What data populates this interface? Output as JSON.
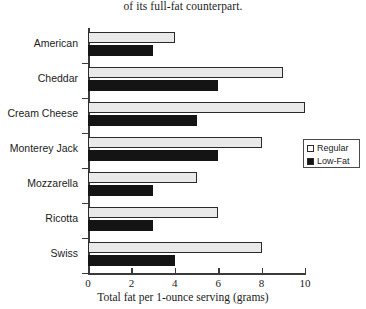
{
  "caption": "of its full-fat counterpart.",
  "legend": {
    "position": "right",
    "entries": [
      {
        "label": "Regular",
        "swatch": "regular-swatch-icon"
      },
      {
        "label": "Low-Fat",
        "swatch": "lowfat-swatch-icon"
      }
    ]
  },
  "colors": {
    "regular_fill": "#e9e9e9",
    "regular_border": "#2a2a2a",
    "lowfat_fill": "#141414",
    "axis": "#3a3a3a",
    "text": "#1b1b1b",
    "background": "#ffffff"
  },
  "chart_data": {
    "type": "bar",
    "orientation": "horizontal",
    "title": "of its full-fat counterpart.",
    "xlabel": "Total fat per 1-ounce serving (grams)",
    "ylabel": "",
    "xlim": [
      0,
      10
    ],
    "xticks": [
      0,
      2,
      4,
      6,
      8,
      10
    ],
    "xtick_labels": [
      "0",
      "2",
      "4",
      "6",
      "8",
      "10"
    ],
    "grid": false,
    "legend_position": "right",
    "categories": [
      "American",
      "Cheddar",
      "Cream Cheese",
      "Monterey Jack",
      "Mozzarella",
      "Ricotta",
      "Swiss"
    ],
    "series": [
      {
        "name": "Regular",
        "values": [
          4,
          9,
          10,
          8,
          5,
          6,
          8
        ]
      },
      {
        "name": "Low-Fat",
        "values": [
          3,
          6,
          5,
          6,
          3,
          3,
          4
        ]
      }
    ]
  }
}
